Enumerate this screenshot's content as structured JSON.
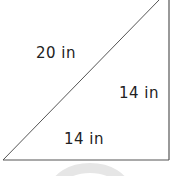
{
  "diagram": {
    "type": "right-triangle",
    "hypotenuse_label": "20 in",
    "vertical_leg_label": "14 in",
    "horizontal_leg_label": "14 in",
    "stroke_color": "#555555",
    "watermark_color": "#e6e6e6"
  }
}
